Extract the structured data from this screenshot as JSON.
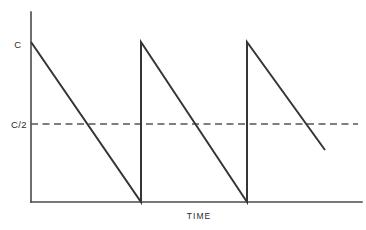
{
  "chart_data": {
    "type": "line",
    "title": "",
    "subtitle": "",
    "xlabel": "TIME",
    "ylabel": "",
    "grid": false,
    "legend": false,
    "legend_position": "none",
    "x": [
      0,
      1,
      1,
      2,
      2,
      2.71
    ],
    "y": [
      1,
      0,
      1,
      0,
      1,
      0.325
    ],
    "series": [
      {
        "name": "sawtooth-waveform",
        "color": "#353535",
        "points": [
          {
            "x": 0,
            "y": 1
          },
          {
            "x": 1,
            "y": 0
          },
          {
            "x": 1,
            "y": 1
          },
          {
            "x": 2,
            "y": 0
          },
          {
            "x": 2,
            "y": 1
          },
          {
            "x": 2.71,
            "y": 0.325
          }
        ]
      }
    ],
    "reference_lines": [
      {
        "name": "half-amplitude-level",
        "orientation": "horizontal",
        "value": 0.5,
        "label": "C/2",
        "style": "dashed",
        "color": "#555555"
      }
    ],
    "ytick_labels": [
      "C",
      "C/2"
    ],
    "ytick_values": [
      1,
      0.5
    ],
    "xtick_labels": [],
    "xlim": [
      0,
      3
    ],
    "ylim": [
      0,
      1.19
    ],
    "peak_label": "C",
    "half_label": "C/2",
    "period_count": 3,
    "axis_color": "#4a4a4a",
    "waveform_color": "#353535",
    "background_color": "#ffffff"
  },
  "labels": {
    "peak": "C",
    "half": "C/2",
    "x_axis_title": "TIME"
  },
  "geometry": {
    "axis_x": 31,
    "axis_top_y": 12,
    "baseline_y": 202,
    "axis_right_x": 362,
    "peak_y": 42,
    "half_y": 124,
    "break1_x": 141,
    "break2_x": 247,
    "tail_end_x": 325,
    "tail_end_y": 150,
    "dash_end_x": 358
  }
}
